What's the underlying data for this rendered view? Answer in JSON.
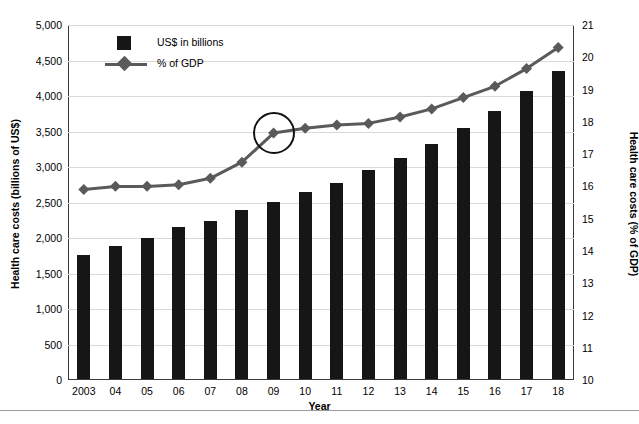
{
  "chart_data": {
    "type": "bar",
    "title": "",
    "xlabel": "Year",
    "ylabel": "Health care costs (billions of US$)",
    "ylabel_right": "Health care costs (% of GDP)",
    "categories": [
      "2003",
      "04",
      "05",
      "06",
      "07",
      "08",
      "09",
      "10",
      "11",
      "12",
      "13",
      "14",
      "15",
      "16",
      "17",
      "18"
    ],
    "full_years": [
      2003,
      2004,
      2005,
      2006,
      2007,
      2008,
      2009,
      2010,
      2011,
      2012,
      2013,
      2014,
      2015,
      2016,
      2017,
      2018
    ],
    "ylim": [
      0,
      5000
    ],
    "ylim_right": [
      10,
      21
    ],
    "yticks": [
      "0",
      "500",
      "1,000",
      "1,500",
      "2,000",
      "2,500",
      "3,000",
      "3,500",
      "4,000",
      "4,500",
      "5,000"
    ],
    "yticks_right": [
      "10",
      "11",
      "12",
      "13",
      "14",
      "15",
      "16",
      "17",
      "18",
      "19",
      "20",
      "21"
    ],
    "grid": true,
    "legend_position": "upper-left-inside",
    "series": [
      {
        "name": "US$ in billions",
        "kind": "bar",
        "axis": "left",
        "color": "#161616",
        "values": [
          1750,
          1880,
          1990,
          2140,
          2230,
          2380,
          2490,
          2630,
          2760,
          2940,
          3110,
          3310,
          3540,
          3780,
          4060,
          4340
        ]
      },
      {
        "name": "% of GDP",
        "kind": "line",
        "axis": "right",
        "color": "#5a5a5a",
        "marker": "diamond",
        "values": [
          15.9,
          16.0,
          16.0,
          16.05,
          16.25,
          16.75,
          17.65,
          17.8,
          17.9,
          17.95,
          18.15,
          18.4,
          18.75,
          19.1,
          19.65,
          20.3
        ]
      }
    ],
    "annotations": [
      {
        "type": "circle-highlight",
        "target_series": "% of GDP",
        "target_category": "09",
        "note": "circle drawn around the 2009 % of GDP data point"
      }
    ]
  },
  "legend": {
    "items": [
      {
        "label": "US$ in billions",
        "marker": "square-swatch"
      },
      {
        "label": "% of GDP",
        "marker": "line-diamond"
      }
    ]
  },
  "axes": {
    "x_title": "Year",
    "y_left_title": "Health care costs (billions of US$)",
    "y_right_title": "Health care costs (% of GDP)"
  },
  "colors": {
    "bar": "#161616",
    "line": "#5a5a5a",
    "grid": "#d9d9d9",
    "frame": "#3a3a3a",
    "background": "#ffffff"
  }
}
